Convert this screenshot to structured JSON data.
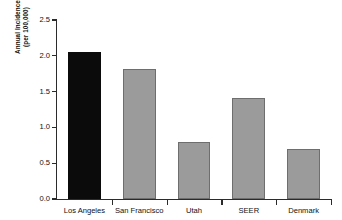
{
  "chart_data": {
    "type": "bar",
    "title": "",
    "xlabel": "",
    "ylabel": "Annual Incidence (per 100,000)",
    "ylabel_line1": "Annual Incidence",
    "ylabel_line2": "(per 100,000)",
    "categories": [
      "Los Angeles",
      "San Francisco",
      "Utah",
      "SEER",
      "Denmark"
    ],
    "values": [
      2.05,
      1.81,
      0.8,
      1.41,
      0.7
    ],
    "bar_colors": [
      "#0b0b0b",
      "#9b9b9b",
      "#9b9b9b",
      "#9b9b9b",
      "#9b9b9b"
    ],
    "highlight_category": "Los Angeles",
    "ylim": [
      0.0,
      2.5
    ],
    "ytick_values": [
      0.0,
      0.5,
      1.0,
      1.5,
      2.0,
      2.5
    ],
    "ytick_labels": [
      "0.0",
      "0.5",
      "1.0",
      "1.5",
      "2.0",
      "2.5"
    ],
    "grid": false,
    "legend": null,
    "legend_position": "none",
    "background_color": "#ffffff",
    "axis_color": "#2b2b2b"
  }
}
